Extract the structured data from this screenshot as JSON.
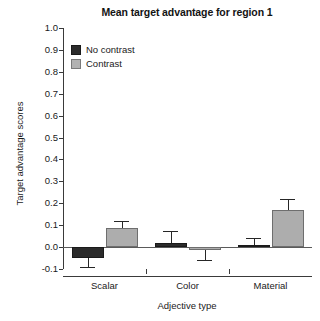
{
  "chart_data": {
    "type": "bar",
    "title": "Mean target advantage for region 1",
    "xlabel": "Adjective type",
    "ylabel": "Target advantage scores",
    "categories": [
      "Scalar",
      "Color",
      "Material"
    ],
    "ylim": [
      -0.1,
      1.0
    ],
    "yticks": [
      "-0.1",
      "0.0",
      "0.1",
      "0.2",
      "0.3",
      "0.4",
      "0.5",
      "0.6",
      "0.7",
      "0.8",
      "0.9",
      "1.0"
    ],
    "ytick_values": [
      -0.1,
      0.0,
      0.1,
      0.2,
      0.3,
      0.4,
      0.5,
      0.6,
      0.7,
      0.8,
      0.9,
      1.0
    ],
    "grid": false,
    "legend_position": "upper-left-inside",
    "series": [
      {
        "name": "No contrast",
        "color": "#2b2b2b",
        "values": [
          -0.05,
          0.02,
          0.01
        ],
        "errors": [
          0.04,
          0.055,
          0.03
        ]
      },
      {
        "name": "Contrast",
        "color": "#adadad",
        "values": [
          0.085,
          -0.015,
          0.17
        ],
        "errors": [
          0.035,
          0.045,
          0.05
        ]
      }
    ]
  },
  "legend": {
    "items": [
      {
        "label": "No contrast",
        "swatch": "dark"
      },
      {
        "label": "Contrast",
        "swatch": "light"
      }
    ]
  }
}
